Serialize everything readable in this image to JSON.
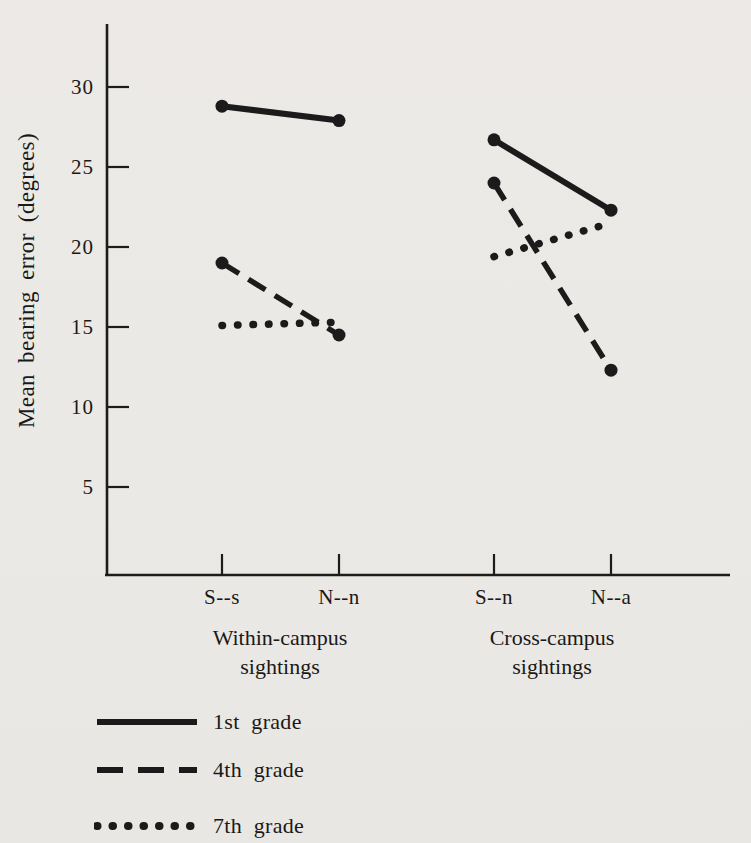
{
  "figure_kind": "scanned book figure, black ink on light paper",
  "colors": {
    "ink": "#1b1b1b",
    "paper": "#ebe9e6"
  },
  "chart_data": {
    "type": "line",
    "title": "",
    "xlabel": "",
    "ylabel": "Mean bearing error (degrees)",
    "categories": [
      "S--s",
      "N--n",
      "S--n",
      "N--a"
    ],
    "category_groups": [
      {
        "label": "Within-campus sightings",
        "line1": "Within-campus",
        "line2": "sightings",
        "category_indexes": [
          0,
          1
        ]
      },
      {
        "label": "Cross-campus sightings",
        "line1": "Cross-campus",
        "line2": "sightings",
        "category_indexes": [
          2,
          3
        ]
      }
    ],
    "segments": [
      [
        0,
        1
      ],
      [
        2,
        3
      ]
    ],
    "yticks": [
      30,
      25,
      20,
      15,
      10,
      5
    ],
    "ylim": [
      0,
      33
    ],
    "grid": false,
    "series": [
      {
        "name": "1st grade",
        "line_style": "solid",
        "values": [
          28.8,
          27.9,
          26.7,
          22.3
        ]
      },
      {
        "name": "4th grade",
        "line_style": "dashed",
        "values": [
          19.0,
          14.5,
          24.0,
          12.3
        ]
      },
      {
        "name": "7th grade",
        "line_style": "dotted",
        "values": [
          15.1,
          15.3,
          19.4,
          21.5
        ]
      }
    ],
    "legend_position": "bottom-left",
    "legend": {
      "items": [
        {
          "label": "1st grade",
          "style": "solid"
        },
        {
          "label": "4th grade",
          "style": "dashed"
        },
        {
          "label": "7th grade",
          "style": "dotted"
        }
      ]
    }
  }
}
